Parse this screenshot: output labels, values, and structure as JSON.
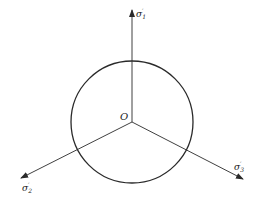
{
  "diagram": {
    "origin_label": "O",
    "axes": [
      {
        "id": "sigma1",
        "base": "σ",
        "sub": "1",
        "prime": "′"
      },
      {
        "id": "sigma2",
        "base": "σ",
        "sub": "2",
        "prime": "′"
      },
      {
        "id": "sigma3",
        "base": "σ",
        "sub": "3",
        "prime": "′"
      }
    ],
    "colors": {
      "line": "#2a2a2a",
      "background": "#ffffff"
    }
  }
}
